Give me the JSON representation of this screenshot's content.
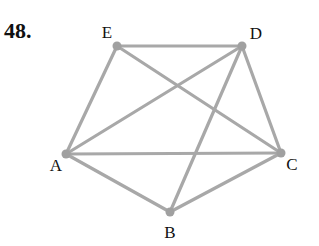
{
  "problem": {
    "number": "48."
  },
  "graph": {
    "edge_color": "#a8a8a8",
    "vertex_color": "#a0a0a0",
    "vertices": [
      {
        "id": "E",
        "label": "E",
        "x": 117,
        "y": 46,
        "lx": 107,
        "ly": 38
      },
      {
        "id": "D",
        "label": "D",
        "x": 242,
        "y": 46,
        "lx": 256,
        "ly": 39
      },
      {
        "id": "A",
        "label": "A",
        "x": 66,
        "y": 154,
        "lx": 56,
        "ly": 171
      },
      {
        "id": "C",
        "label": "C",
        "x": 281,
        "y": 153,
        "lx": 292,
        "ly": 170
      },
      {
        "id": "B",
        "label": "B",
        "x": 170,
        "y": 212,
        "lx": 170,
        "ly": 238
      }
    ],
    "edges": [
      [
        "E",
        "D"
      ],
      [
        "E",
        "A"
      ],
      [
        "E",
        "C"
      ],
      [
        "D",
        "A"
      ],
      [
        "D",
        "B"
      ],
      [
        "D",
        "C"
      ],
      [
        "A",
        "C"
      ],
      [
        "A",
        "B"
      ],
      [
        "B",
        "C"
      ]
    ]
  }
}
